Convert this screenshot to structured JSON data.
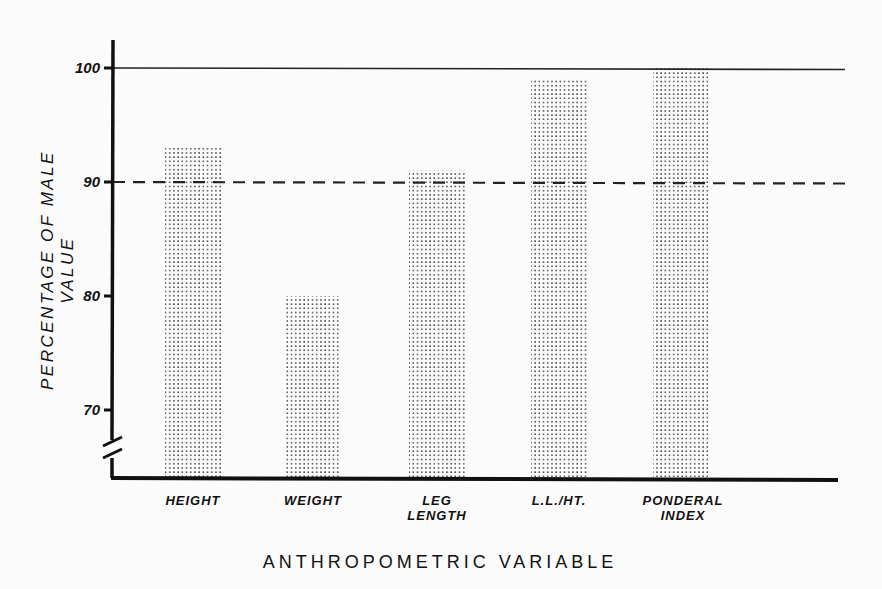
{
  "chart_data": {
    "type": "bar",
    "title": "",
    "xlabel": "ANTHROPOMETRIC VARIABLE",
    "ylabel": "PERCENTAGE OF MALE VALUE",
    "categories": [
      "HEIGHT",
      "WEIGHT",
      "LEG LENGTH",
      "L.L./HT.",
      "PONDERAL INDEX"
    ],
    "category_lines": [
      [
        "HEIGHT"
      ],
      [
        "WEIGHT"
      ],
      [
        "LEG",
        "LENGTH"
      ],
      [
        "L.L./HT."
      ],
      [
        "PONDERAL",
        "INDEX"
      ]
    ],
    "values": [
      93,
      80,
      91,
      99,
      100
    ],
    "yticks": [
      70,
      80,
      90,
      100
    ],
    "ylim": [
      65,
      103
    ],
    "axis_break": true,
    "reference_lines": [
      {
        "y": 100,
        "style": "solid"
      },
      {
        "y": 90,
        "style": "dashed"
      }
    ],
    "grid": false,
    "legend": null,
    "bar_fill": "stippled"
  }
}
